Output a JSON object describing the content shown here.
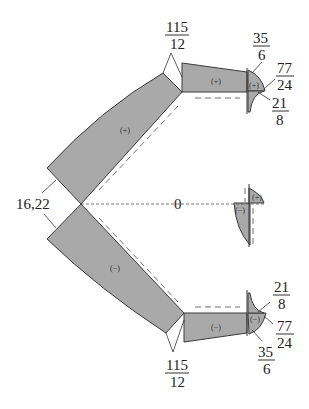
{
  "diagram": {
    "type": "internal force diagram (axial/shear) of symmetric frame",
    "fill_color": "#a9a9a9",
    "stroke_color": "#3a3a3a",
    "labels": {
      "top_joint": {
        "num": "115",
        "den": "12"
      },
      "top_right_a": {
        "num": "35",
        "den": "6"
      },
      "top_right_b": {
        "num": "77",
        "den": "24"
      },
      "top_right_c": {
        "num": "21",
        "den": "8"
      },
      "apex": "16,22",
      "center": "0",
      "bottom_joint": {
        "num": "115",
        "den": "12"
      },
      "bottom_right_a": {
        "num": "21",
        "den": "8"
      },
      "bottom_right_b": {
        "num": "77",
        "den": "24"
      },
      "bottom_right_c": {
        "num": "35",
        "den": "6"
      }
    },
    "signs": {
      "upper_incline": "(+)",
      "upper_horizontal": "(+)",
      "upper_tip": "(+)",
      "middle_upper": "(+)",
      "middle_lower": "(−)",
      "lower_incline": "(−)",
      "lower_horizontal": "(−)",
      "lower_tip": "(−)"
    }
  }
}
